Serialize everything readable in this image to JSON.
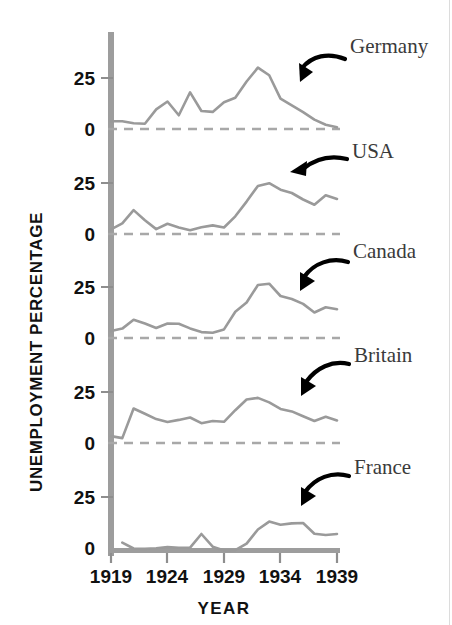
{
  "chart_data": {
    "type": "line",
    "title": "",
    "xlabel": "YEAR",
    "ylabel": "UNEMPLOYMENT PERCENTAGE",
    "x": [
      1919,
      1920,
      1921,
      1922,
      1923,
      1924,
      1925,
      1926,
      1927,
      1928,
      1929,
      1930,
      1931,
      1932,
      1933,
      1934,
      1935,
      1936,
      1937,
      1938,
      1939
    ],
    "xlim": [
      1919,
      1939
    ],
    "xticks": [
      "1919",
      "1924",
      "1929",
      "1934",
      "1939"
    ],
    "xtick_values": [
      1919,
      1924,
      1929,
      1934,
      1939
    ],
    "yticks": [
      "0",
      "25"
    ],
    "ytick_values": [
      0,
      25
    ],
    "ylim": [
      0,
      45
    ],
    "grid": false,
    "legend": "annotated-arrows",
    "panel_layout": "stacked-small-multiples",
    "series": [
      {
        "name": "Germany",
        "label": "Germany",
        "values": [
          3.8,
          3.8,
          2.8,
          2.6,
          9.6,
          13.5,
          6.7,
          18.0,
          8.8,
          8.4,
          13.1,
          15.3,
          23.3,
          30.1,
          26.3,
          14.9,
          11.6,
          8.3,
          4.6,
          2.1,
          0.9
        ]
      },
      {
        "name": "USA",
        "label": "USA",
        "values": [
          2.3,
          5.2,
          11.7,
          6.7,
          2.4,
          5.0,
          3.2,
          1.8,
          3.3,
          4.2,
          3.2,
          8.7,
          15.9,
          23.6,
          24.9,
          21.7,
          20.1,
          16.9,
          14.3,
          19.0,
          17.2
        ]
      },
      {
        "name": "Canada",
        "label": "Canada",
        "values": [
          3.4,
          4.6,
          8.9,
          7.1,
          4.9,
          7.1,
          7.0,
          4.7,
          2.9,
          2.6,
          4.2,
          12.9,
          17.4,
          26.0,
          26.6,
          20.6,
          19.1,
          16.7,
          12.5,
          15.1,
          14.1
        ]
      },
      {
        "name": "Britain",
        "label": "Britain",
        "values": [
          3.4,
          2.4,
          16.9,
          14.3,
          11.7,
          10.3,
          11.3,
          12.5,
          9.7,
          10.8,
          10.4,
          16.1,
          21.3,
          22.1,
          19.9,
          16.7,
          15.5,
          13.1,
          10.8,
          12.9,
          11.1
        ]
      },
      {
        "name": "France",
        "label": "France",
        "values": [
          null,
          5.1,
          2.2,
          2.0,
          2.3,
          2.9,
          2.6,
          2.6,
          9.3,
          3.1,
          1.2,
          1.4,
          4.6,
          11.5,
          15.4,
          13.8,
          14.5,
          14.7,
          9.4,
          8.8,
          9.3
        ]
      }
    ],
    "colors": {
      "line": "#9a9a9a",
      "axis": "#9a9a9a",
      "zero_dash": "#a8a8a8",
      "tick_text": "#111111",
      "label_text": "#3a3a3a",
      "arrow": "#000000",
      "background": "#ffffff"
    }
  },
  "annotations": [
    {
      "name": "Germany",
      "text": "Germany"
    },
    {
      "name": "USA",
      "text": "USA"
    },
    {
      "name": "Canada",
      "text": "Canada"
    },
    {
      "name": "Britain",
      "text": "Britain"
    },
    {
      "name": "France",
      "text": "France"
    }
  ],
  "axis": {
    "y_title": "UNEMPLOYMENT PERCENTAGE",
    "x_title": "YEAR",
    "y_ticks": [
      "25",
      "0",
      "25",
      "0",
      "25",
      "0",
      "25",
      "0",
      "25",
      "0"
    ],
    "x_ticks": [
      "1919",
      "1924",
      "1929",
      "1934",
      "1939"
    ]
  },
  "ghost_text": {
    "top": ""
  }
}
